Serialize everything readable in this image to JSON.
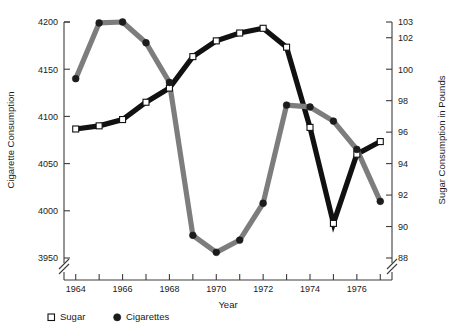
{
  "chart_data": {
    "type": "line",
    "title": "",
    "xlabel": "Year",
    "ylabel_left": "Cigarette Consumption",
    "ylabel_right": "Sugar Consumption in Pounds",
    "x": [
      1964,
      1965,
      1966,
      1967,
      1968,
      1969,
      1970,
      1971,
      1972,
      1973,
      1974,
      1975,
      1976,
      1977
    ],
    "xlim": [
      1963.5,
      1977.5
    ],
    "xticks": [
      1964,
      1965,
      1966,
      1967,
      1968,
      1969,
      1970,
      1971,
      1972,
      1973,
      1974,
      1975,
      1976,
      1977
    ],
    "xticklabels": [
      "1964",
      "",
      "1966",
      "",
      "1968",
      "",
      "1970",
      "",
      "1972",
      "",
      "1974",
      "",
      "1976",
      ""
    ],
    "left_axis": {
      "label": "Cigarette Consumption",
      "ylim": [
        3950,
        4200
      ],
      "ticks": [
        3950,
        4000,
        4050,
        4100,
        4150,
        4200
      ],
      "ticklabels": [
        "3950",
        "4000",
        "4050",
        "4100",
        "4150",
        "4200"
      ],
      "axis_break": true
    },
    "right_axis": {
      "label": "Sugar Consumption in Pounds",
      "ylim": [
        88,
        103
      ],
      "ticks": [
        88,
        90,
        92,
        94,
        96,
        98,
        100,
        102,
        103
      ],
      "ticklabels": [
        "88",
        "90",
        "92",
        "94",
        "96",
        "98",
        "100",
        "102",
        "103"
      ],
      "axis_break": true
    },
    "grid": false,
    "legend_position": "below-left",
    "series": [
      {
        "name": "Sugar",
        "axis": "right",
        "marker": "open-square",
        "color": "#111111",
        "marker_fill": "#ffffff",
        "values": [
          96.2,
          96.4,
          96.8,
          97.9,
          98.8,
          100.8,
          101.8,
          102.3,
          102.6,
          101.4,
          96.3,
          90.2,
          94.6,
          95.4
        ]
      },
      {
        "name": "Cigarettes",
        "axis": "left",
        "marker": "filled-circle",
        "color": "#7d7d7d",
        "marker_fill": "#1c1c1c",
        "values": [
          4140,
          4199,
          4200,
          4178,
          4136,
          3974,
          3956,
          3969,
          4008,
          4112,
          4110,
          4095,
          4065,
          4010
        ]
      }
    ]
  },
  "legend": {
    "items": [
      {
        "label": "Sugar",
        "marker": "open-square"
      },
      {
        "label": "Cigarettes",
        "marker": "filled-circle"
      }
    ]
  }
}
